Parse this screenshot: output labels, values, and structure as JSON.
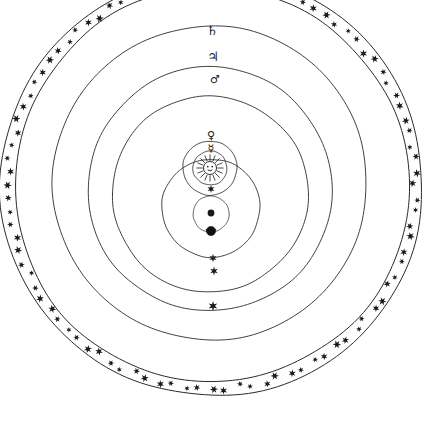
{
  "figure": {
    "background_color": "#ffffff",
    "ink_color": "#1a1a1a",
    "line_color": "#2b2b2b",
    "width": 436,
    "height": 436
  },
  "system": {
    "center_x": 212,
    "center_y": 185,
    "sun_x": 210,
    "sun_y": 168,
    "earth_x": 210,
    "earth_y": 214
  },
  "star_band": {
    "name": "sphere-of-fixed-stars",
    "outer_radius": 211,
    "inner_radius": 197,
    "star_count": 96,
    "star_color": "#1a1a1a",
    "star_points": 6,
    "star_size": 3.6
  },
  "orbits": [
    {
      "id": "saturn",
      "label": "♄",
      "name": "Saturn",
      "radius": 157,
      "center_offset_y": -2,
      "label_x": 212,
      "label_y": 31,
      "marker_star": {
        "x": 213,
        "y": 306,
        "size": 5.0
      }
    },
    {
      "id": "jupiter",
      "label": "♃",
      "name": "Jupiter",
      "radius": 122,
      "center_offset_y": 4,
      "label_x": 213,
      "label_y": 57,
      "marker_star": {
        "x": 214,
        "y": 271,
        "size": 4.4
      }
    },
    {
      "id": "mars",
      "label": "♂",
      "name": "Mars",
      "radius": 98,
      "center_offset_y": 9,
      "label_x": 215,
      "label_y": 80,
      "marker_star": {
        "x": 213,
        "y": 258,
        "size": 4.2
      }
    },
    {
      "id": "venus",
      "label": "♀",
      "name": "Venus",
      "radius": 27,
      "center_offset_y": 0,
      "label_x": 211,
      "label_y": 136,
      "marker_star": null
    },
    {
      "id": "mercury",
      "label": "☿",
      "name": "Mercury",
      "radius": 17,
      "center_offset_y": 0,
      "label_x": 211,
      "label_y": 149,
      "marker_star": null
    }
  ],
  "sun": {
    "name": "Sun",
    "label": "☉",
    "disc_radius": 6.5,
    "ray_count": 16,
    "ray_length": 5.5,
    "marker_star": {
      "x": 211,
      "y": 189,
      "size": 4.0
    }
  },
  "earth_moon": {
    "lunar_sphere_radius": 49,
    "lunar_sphere_center_x": 211,
    "lunar_sphere_center_y": 208,
    "moon_orbit_radius": 18,
    "moon_orbit_center_x": 211,
    "moon_orbit_center_y": 214,
    "earth_label": "⊙",
    "earth_radius": 3.4,
    "moon_label": "☾",
    "moon_x": 211,
    "moon_y": 231,
    "moon_radius": 4.6
  }
}
